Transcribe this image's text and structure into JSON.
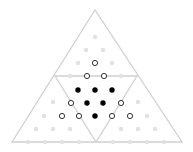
{
  "diagram": {
    "colors": {
      "background": "#ffffff",
      "line": "#d0d0d0",
      "faint_dot": "#e2e2e2",
      "filled_dot": "#000000",
      "open_dot_stroke": "#333333"
    },
    "outer_triangle": [
      [
        95,
        10
      ],
      [
        12,
        142
      ],
      [
        182,
        142
      ]
    ],
    "inner_triangle": [
      [
        55,
        76
      ],
      [
        137,
        76
      ],
      [
        96,
        142
      ]
    ],
    "filled_dots": [
      [
        78,
        90
      ],
      [
        95,
        90
      ],
      [
        112,
        90
      ],
      [
        87,
        103
      ],
      [
        103,
        103
      ],
      [
        95,
        116
      ]
    ],
    "open_dots": [
      [
        95,
        63
      ],
      [
        87,
        76
      ],
      [
        104,
        76
      ],
      [
        71,
        103
      ],
      [
        121,
        103
      ],
      [
        62,
        116
      ],
      [
        79,
        116
      ],
      [
        112,
        116
      ],
      [
        130,
        116
      ]
    ],
    "faint_dots": [
      [
        95,
        37
      ],
      [
        86,
        50
      ],
      [
        103,
        50
      ],
      [
        78,
        63
      ],
      [
        112,
        63
      ],
      [
        70,
        76
      ],
      [
        121,
        76
      ],
      [
        53,
        102
      ],
      [
        138,
        102
      ],
      [
        44,
        116
      ],
      [
        147,
        116
      ],
      [
        36,
        129
      ],
      [
        53,
        129
      ],
      [
        70,
        129
      ],
      [
        121,
        129
      ],
      [
        138,
        129
      ],
      [
        155,
        129
      ],
      [
        28,
        142
      ],
      [
        45,
        142
      ],
      [
        62,
        142
      ],
      [
        79,
        142
      ],
      [
        113,
        142
      ],
      [
        130,
        142
      ],
      [
        147,
        142
      ],
      [
        164,
        142
      ]
    ]
  }
}
